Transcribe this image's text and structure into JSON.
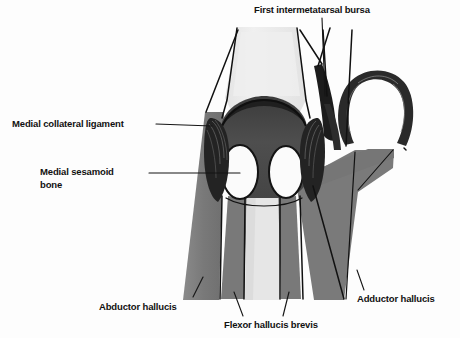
{
  "figure": {
    "type": "anatomical-illustration",
    "width": 460,
    "height": 338,
    "background_color": "#fdfdfd"
  },
  "palette": {
    "bone_light": "#ececec",
    "bone_mid": "#dcdcdc",
    "capsule_dark": "#4a4a4a",
    "capsule_darker": "#3a3a3a",
    "muscle_gray": "#7d7d7d",
    "muscle_gray_dark": "#6e6e6e",
    "ligament_black": "#1e1e1e",
    "sesamoid_white": "#fbfbfb",
    "outline_black": "#0d0d0d",
    "label_text": "#111111"
  },
  "labels": {
    "first_intermetatarsal_bursa": "First intermetatarsal bursa",
    "medial_collateral_ligament": "Medial collateral ligament",
    "medial_sesamoid_bone": "Medial sesamoid\nbone",
    "abductor_hallucis": "Abductor hallucis",
    "flexor_hallucis_brevis": "Flexor hallucis brevis",
    "adductor_hallucis": "Adductor hallucis"
  },
  "structures": [
    {
      "name": "metatarsal-head",
      "tone": "bone_light"
    },
    {
      "name": "articular-cartilage-cap",
      "tone": "capsule_dark"
    },
    {
      "name": "joint-capsule",
      "tone": "capsule_dark"
    },
    {
      "name": "medial-sesamoid",
      "tone": "sesamoid_white"
    },
    {
      "name": "lateral-sesamoid",
      "tone": "sesamoid_white"
    },
    {
      "name": "proximal-phalanx",
      "tone": "bone_mid"
    },
    {
      "name": "medial-collateral-ligament",
      "tone": "ligament_black"
    },
    {
      "name": "lateral-collateral-ligament",
      "tone": "ligament_black"
    },
    {
      "name": "second-metatarsal-arch",
      "tone": "capsule_darker"
    },
    {
      "name": "first-intermetatarsal-bursa",
      "tone": "ligament_black"
    },
    {
      "name": "abductor-hallucis-muscle",
      "tone": "muscle_gray"
    },
    {
      "name": "flexor-hallucis-brevis-medial-head",
      "tone": "muscle_gray"
    },
    {
      "name": "flexor-hallucis-brevis-lateral-head",
      "tone": "muscle_gray"
    },
    {
      "name": "adductor-hallucis-muscle",
      "tone": "muscle_gray"
    }
  ]
}
